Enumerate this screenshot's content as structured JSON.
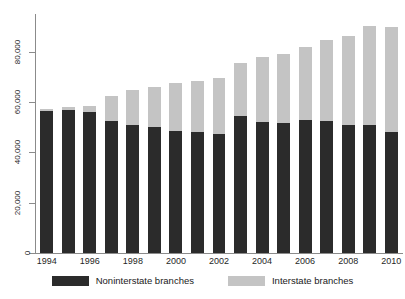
{
  "chart_data": {
    "type": "bar",
    "subtype": "stacked-vertical",
    "title": "",
    "xlabel": "",
    "ylabel": "",
    "ylim": [
      0,
      95000
    ],
    "yticks": [
      0,
      20000,
      40000,
      60000,
      80000
    ],
    "ytick_labels": [
      "0",
      "20,000",
      "40,000",
      "60,000",
      "80,000"
    ],
    "grid": false,
    "legend_position": "bottom-center",
    "categories": [
      "1994",
      "1995",
      "1996",
      "1997",
      "1998",
      "1999",
      "2000",
      "2001",
      "2002",
      "2003",
      "2004",
      "2005",
      "2006",
      "2007",
      "2008",
      "2009",
      "2010"
    ],
    "xtick_labels_shown": [
      "1994",
      "1996",
      "1998",
      "2000",
      "2002",
      "2004",
      "2006",
      "2008",
      "2010"
    ],
    "series": [
      {
        "name": "Noninterstate branches",
        "color": "#2b2b2b",
        "values": [
          56500,
          56700,
          56200,
          52400,
          50900,
          50200,
          48400,
          48000,
          47500,
          54300,
          52000,
          51700,
          53000,
          52400,
          51000,
          50700,
          48000
        ]
      },
      {
        "name": "Interstate branches",
        "color": "#c4c4c4",
        "values": [
          800,
          1200,
          2200,
          10000,
          13700,
          15800,
          19100,
          20400,
          21900,
          21400,
          25800,
          27500,
          28800,
          32200,
          35200,
          39400,
          41800
        ]
      }
    ],
    "totals": [
      57300,
      57900,
      58400,
      62400,
      64600,
      66000,
      67500,
      68400,
      69400,
      75700,
      77800,
      79200,
      81800,
      84600,
      86200,
      90100,
      89800
    ]
  },
  "legend": {
    "entries": [
      {
        "label": "Noninterstate branches",
        "color": "#2b2b2b"
      },
      {
        "label": "Interstate branches",
        "color": "#c4c4c4"
      }
    ]
  },
  "axis": {
    "y_labels": [
      "0",
      "20,000",
      "40,000",
      "60,000",
      "80,000"
    ],
    "x_labels": [
      "1994",
      "1996",
      "1998",
      "2000",
      "2002",
      "2004",
      "2006",
      "2008",
      "2010"
    ]
  }
}
